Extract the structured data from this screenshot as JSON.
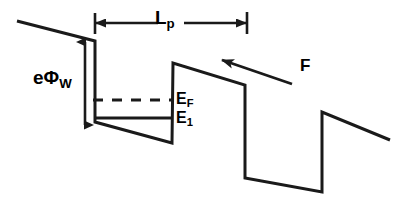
{
  "figure": {
    "type": "energy-band-diagram",
    "background_color": "#ffffff",
    "line_color": "#1a1a1a",
    "line_width": 3
  },
  "labels": {
    "work_function": {
      "base": "e",
      "symbol": "Φ",
      "subscript": "W",
      "full": "eΦW"
    },
    "period": {
      "base": "L",
      "subscript": "p",
      "full": "Lp"
    },
    "fermi_level": {
      "base": "E",
      "subscript": "F",
      "full": "EF"
    },
    "ground_state": {
      "base": "E",
      "subscript": "1",
      "full": "E1"
    },
    "field": {
      "base": "F",
      "full": "F"
    }
  },
  "chart_data": {
    "type": "line",
    "title": "",
    "xlabel": "",
    "ylabel": "",
    "xlim": [
      0,
      404
    ],
    "ylim": [
      205,
      0
    ],
    "grid": false,
    "legend": null,
    "series": [
      {
        "name": "band-edge-profile",
        "style": "solid",
        "width": 3,
        "points": [
          [
            17,
            21
          ],
          [
            95,
            41
          ],
          [
            95,
            122
          ],
          [
            172,
            143
          ],
          [
            173,
            63
          ],
          [
            245,
            85
          ],
          [
            245,
            178
          ],
          [
            322,
            192
          ],
          [
            322,
            112
          ],
          [
            390,
            140
          ]
        ]
      },
      {
        "name": "fermi-level-line",
        "style": "dashed",
        "width": 3,
        "dash": "10,9",
        "points": [
          [
            93,
            100
          ],
          [
            172,
            100
          ]
        ]
      },
      {
        "name": "ground-state-line",
        "style": "solid",
        "width": 3,
        "points": [
          [
            95,
            118
          ],
          [
            172,
            118
          ]
        ]
      }
    ],
    "annotations": [
      {
        "name": "work-function-arrow",
        "kind": "double-arrow",
        "orientation": "vertical",
        "x": 85,
        "y_from": 42,
        "y_to": 125,
        "label": "eΦW"
      },
      {
        "name": "period-arrow",
        "kind": "double-arrow",
        "orientation": "horizontal",
        "y": 23,
        "x_from": 96,
        "x_to": 246,
        "label": "Lp",
        "ticks": [
          {
            "x": 95,
            "y_from": 13,
            "y_to": 34
          },
          {
            "x": 247,
            "y_from": 12,
            "y_to": 34
          }
        ]
      },
      {
        "name": "field-arrow",
        "kind": "single-arrow",
        "orientation": "diagonal",
        "tip": [
          222,
          60
        ],
        "tail": [
          292,
          84
        ],
        "label": "F"
      }
    ]
  }
}
